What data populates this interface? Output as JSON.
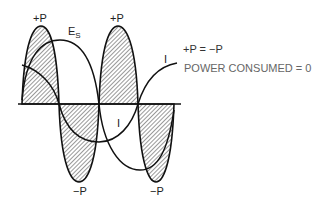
{
  "diagram": {
    "curves": [
      {
        "id": "voltage",
        "label": "E",
        "subscript": "S"
      },
      {
        "id": "current",
        "label": "I"
      },
      {
        "id": "power",
        "label": "P"
      }
    ],
    "peak_labels": {
      "pos_1": "+P",
      "pos_2": "+P",
      "neg_1": "−P",
      "neg_2": "−P"
    },
    "current_labels": {
      "upper": "I",
      "lower": "I"
    },
    "notes": {
      "equation": "+P = −P",
      "result": "POWER CONSUMED = 0"
    },
    "colors": {
      "ink": "#111111",
      "note_text": "#555555",
      "hatch": "#333333"
    }
  }
}
